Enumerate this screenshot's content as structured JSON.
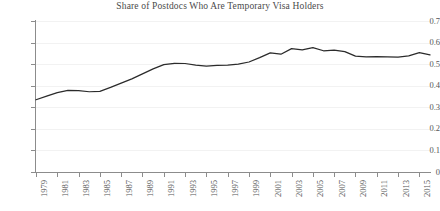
{
  "chart_data": {
    "type": "line",
    "title": "Share of Postdocs Who Are Temporary Visa Holders",
    "xlabel": "",
    "ylabel": "",
    "x": [
      1979,
      1980,
      1981,
      1982,
      1983,
      1984,
      1985,
      1986,
      1987,
      1988,
      1989,
      1990,
      1991,
      1992,
      1993,
      1994,
      1995,
      1996,
      1997,
      1998,
      1999,
      2000,
      2001,
      2002,
      2003,
      2004,
      2005,
      2006,
      2007,
      2008,
      2009,
      2010,
      2011,
      2012,
      2013,
      2014,
      2015,
      2016
    ],
    "values": [
      0.335,
      0.352,
      0.368,
      0.378,
      0.377,
      0.372,
      0.374,
      0.392,
      0.412,
      0.432,
      0.455,
      0.478,
      0.498,
      0.504,
      0.503,
      0.496,
      0.491,
      0.494,
      0.496,
      0.5,
      0.51,
      0.53,
      0.552,
      0.546,
      0.572,
      0.566,
      0.577,
      0.562,
      0.565,
      0.558,
      0.537,
      0.534,
      0.535,
      0.534,
      0.533,
      0.538,
      0.553,
      0.543
    ],
    "series": [
      {
        "name": "Share of postdocs who are temporary visa holders",
        "values": [
          0.335,
          0.352,
          0.368,
          0.378,
          0.377,
          0.372,
          0.374,
          0.392,
          0.412,
          0.432,
          0.455,
          0.478,
          0.498,
          0.504,
          0.503,
          0.496,
          0.491,
          0.494,
          0.496,
          0.5,
          0.51,
          0.53,
          0.552,
          0.546,
          0.572,
          0.566,
          0.577,
          0.562,
          0.565,
          0.558,
          0.537,
          0.534,
          0.535,
          0.534,
          0.533,
          0.538,
          0.553,
          0.543
        ],
        "color": "#2b2b2b"
      }
    ],
    "xlim": [
      1979,
      2016
    ],
    "ylim": [
      0,
      0.7
    ],
    "y_ticks": [
      0,
      0.1,
      0.2,
      0.3,
      0.4,
      0.5,
      0.6,
      0.7
    ],
    "y_tick_labels": [
      "0",
      "0.1",
      "0.2",
      "0.3",
      "0.4",
      "0.5",
      "0.6",
      "0.7"
    ],
    "x_ticks": [
      1979,
      1981,
      1983,
      1985,
      1987,
      1989,
      1991,
      1993,
      1995,
      1997,
      1999,
      2001,
      2003,
      2005,
      2007,
      2009,
      2011,
      2013,
      2015
    ],
    "x_tick_labels": [
      "1979",
      "1981",
      "1983",
      "1985",
      "1987",
      "1989",
      "1991",
      "1993",
      "1995",
      "1997",
      "1999",
      "2001",
      "2003",
      "2005",
      "2007",
      "2009",
      "2011",
      "2013",
      "2015"
    ],
    "x_tick_label_rotation": -90,
    "grid": "horizontal",
    "grid_color": "#f2f2f2",
    "legend": "none",
    "background": "#ffffff",
    "axis_color": "#8c8c8c"
  }
}
